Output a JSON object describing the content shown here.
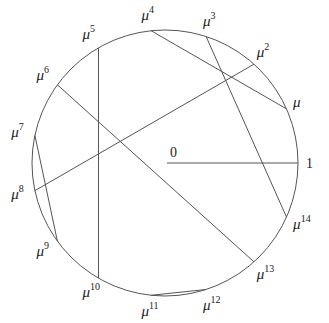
{
  "diagram": {
    "type": "roots-of-unity-circle",
    "center_label": "0",
    "unit_label": "1",
    "base_symbol": "μ",
    "n_points": 15,
    "stroke_color": "#555555",
    "labels": [
      {
        "k": 1,
        "text": "μ",
        "sup": ""
      },
      {
        "k": 2,
        "text": "μ",
        "sup": "2"
      },
      {
        "k": 3,
        "text": "μ",
        "sup": "3"
      },
      {
        "k": 4,
        "text": "μ",
        "sup": "4"
      },
      {
        "k": 5,
        "text": "μ",
        "sup": "5"
      },
      {
        "k": 6,
        "text": "μ",
        "sup": "6"
      },
      {
        "k": 7,
        "text": "μ",
        "sup": "7"
      },
      {
        "k": 8,
        "text": "μ",
        "sup": "8"
      },
      {
        "k": 9,
        "text": "μ",
        "sup": "9"
      },
      {
        "k": 10,
        "text": "μ",
        "sup": "10"
      },
      {
        "k": 11,
        "text": "μ",
        "sup": "11"
      },
      {
        "k": 12,
        "text": "μ",
        "sup": "12"
      },
      {
        "k": 13,
        "text": "μ",
        "sup": "13"
      },
      {
        "k": 14,
        "text": "μ",
        "sup": "14"
      }
    ],
    "chords": [
      [
        4,
        1
      ],
      [
        3,
        14
      ],
      [
        2,
        8
      ],
      [
        5,
        10
      ],
      [
        6,
        13
      ],
      [
        7,
        9
      ],
      [
        11,
        12
      ]
    ],
    "radius_segment": [
      "0",
      "1"
    ]
  }
}
